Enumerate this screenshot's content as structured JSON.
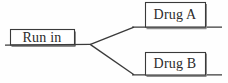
{
  "diagram": {
    "type": "randomization-flow-tree",
    "title": "",
    "stroke_color": "#3a3a3a",
    "shadow_color": "#8a8a8a",
    "background_color": "#fefefe",
    "text_color": "#2b2b2b",
    "nodes": [
      {
        "id": "run-in",
        "label": "Run in",
        "role": "root",
        "box": {
          "x": 10,
          "y": 29,
          "width": 64,
          "height": 16
        },
        "baseline": {
          "x1": 6,
          "x2": 91,
          "y": 45
        }
      },
      {
        "id": "drug-a",
        "label": "Drug A",
        "role": "branch-upper",
        "box": {
          "x": 145,
          "y": 2,
          "width": 60,
          "height": 25
        },
        "baseline": {
          "x1": 133,
          "x2": 222,
          "y": 27
        }
      },
      {
        "id": "drug-b",
        "label": "Drug B",
        "role": "branch-lower",
        "box": {
          "x": 145,
          "y": 52,
          "width": 60,
          "height": 23
        },
        "baseline": {
          "x1": 133,
          "x2": 222,
          "y": 75
        }
      }
    ],
    "fork": {
      "vertex": {
        "x": 91,
        "y": 44
      },
      "edges": [
        {
          "from": "fork-vertex",
          "to": "drug-a",
          "x1": 91,
          "y1": 44,
          "x2": 134,
          "y2": 27
        },
        {
          "from": "fork-vertex",
          "to": "drug-b",
          "x1": 91,
          "y1": 44,
          "x2": 134,
          "y2": 75
        }
      ]
    }
  }
}
